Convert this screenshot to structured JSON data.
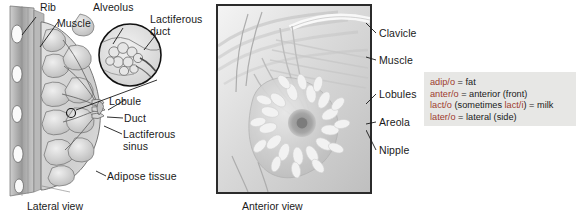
{
  "figure": {
    "panels": [
      {
        "id": "lateral",
        "caption": "Lateral view",
        "labels": [
          {
            "name": "rib",
            "text": "Rib"
          },
          {
            "name": "muscle",
            "text": "Muscle"
          },
          {
            "name": "alveolus",
            "text": "Alveolus"
          },
          {
            "name": "lactiferous-duct",
            "text": "Lactiferous\nduct"
          },
          {
            "name": "lobule",
            "text": "Lobule"
          },
          {
            "name": "duct",
            "text": "Duct"
          },
          {
            "name": "lactiferous-sinus",
            "text": "Lactiferous\nsinus"
          },
          {
            "name": "adipose-tissue",
            "text": "Adipose tissue"
          }
        ]
      },
      {
        "id": "anterior",
        "caption": "Anterior view",
        "labels": [
          {
            "name": "clavicle",
            "text": "Clavicle"
          },
          {
            "name": "muscle",
            "text": "Muscle"
          },
          {
            "name": "lobules",
            "text": "Lobules"
          },
          {
            "name": "areola",
            "text": "Areola"
          },
          {
            "name": "nipple",
            "text": "Nipple"
          }
        ]
      }
    ]
  },
  "terminology": {
    "entries": [
      {
        "form": "adip/o",
        "rest": " = fat",
        "form2": "",
        "rest2": ""
      },
      {
        "form": "anter/o",
        "rest": " = anterior (front)",
        "form2": "",
        "rest2": ""
      },
      {
        "form": "lact/o",
        "rest": " (sometimes ",
        "form2": "lact/i",
        "rest2": ") = milk"
      },
      {
        "form": "later/o",
        "rest": " = lateral (side)",
        "form2": "",
        "rest2": ""
      }
    ]
  },
  "colors": {
    "combining_form": "#9e3b2e",
    "box_background": "#e7e7e5",
    "label_text": "#1a1a1a",
    "panel_border": "#2b2b2b"
  }
}
